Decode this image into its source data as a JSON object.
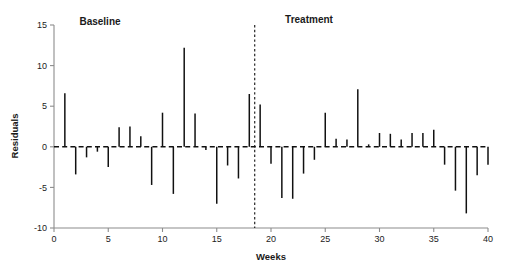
{
  "chart_data": {
    "type": "bar",
    "title": "",
    "xlabel": "Weeks",
    "ylabel": "Residuals",
    "xlim": [
      0,
      40
    ],
    "ylim": [
      -10,
      15
    ],
    "xticks": [
      0,
      5,
      10,
      15,
      20,
      25,
      30,
      35,
      40
    ],
    "yticks": [
      -10,
      -5,
      0,
      5,
      10,
      15
    ],
    "grid": false,
    "legend": "none",
    "categories": [
      1,
      2,
      3,
      4,
      5,
      6,
      7,
      8,
      9,
      10,
      11,
      12,
      13,
      14,
      15,
      16,
      17,
      18,
      19,
      20,
      21,
      22,
      23,
      24,
      25,
      26,
      27,
      28,
      29,
      30,
      31,
      32,
      33,
      34,
      35,
      36,
      37,
      38,
      39,
      40
    ],
    "values": [
      6.6,
      -3.4,
      -1.3,
      -0.6,
      -2.5,
      2.4,
      2.5,
      1.3,
      -4.7,
      4.2,
      -5.8,
      12.2,
      4.1,
      -0.4,
      -7.0,
      -2.3,
      -3.9,
      6.5,
      5.2,
      -2.1,
      -6.3,
      -6.4,
      -3.3,
      -1.6,
      4.2,
      1.0,
      0.9,
      7.1,
      0.3,
      1.7,
      1.6,
      0.9,
      1.7,
      1.7,
      2.1,
      -2.2,
      -5.4,
      -8.2,
      -3.5,
      -2.2
    ],
    "annotations": [
      {
        "name": "baseline-label",
        "text": "Baseline",
        "x": 8,
        "y": 14.2
      },
      {
        "name": "treatment-label",
        "text": "Treatment",
        "x": 26.5,
        "y": 14.2
      }
    ],
    "phase_divider": {
      "x": 18.5,
      "style": "dotted",
      "label": "phase-change-line"
    }
  },
  "colors": {
    "bar": "#111111",
    "axis": "#8c8c8c",
    "text": "#1a1a1a",
    "background": "#ffffff"
  }
}
